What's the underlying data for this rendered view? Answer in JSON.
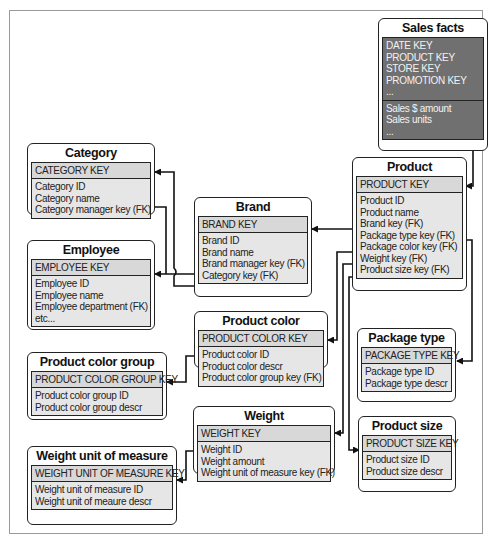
{
  "diagram": {
    "type": "snowflake-schema",
    "entities": {
      "sales_facts": {
        "title": "Sales facts",
        "keys": [
          "DATE KEY",
          "PRODUCT KEY",
          "STORE KEY",
          "PROMOTION KEY",
          "..."
        ],
        "attributes": [
          "Sales $ amount",
          "Sales units",
          "..."
        ]
      },
      "product": {
        "title": "Product",
        "key": "PRODUCT KEY",
        "attributes": [
          "Product ID",
          "Product name",
          "Brand key (FK)",
          "Package type key (FK)",
          "Package color key (FK)",
          "Weight key (FK)",
          "Product size key (FK)"
        ]
      },
      "category": {
        "title": "Category",
        "key": "CATEGORY KEY",
        "attributes": [
          "Category ID",
          "Category name",
          "Category manager key (FK)"
        ]
      },
      "employee": {
        "title": "Employee",
        "key": "EMPLOYEE KEY",
        "attributes": [
          "Employee ID",
          "Employee name",
          "Employee department (FK)",
          "etc..."
        ]
      },
      "brand": {
        "title": "Brand",
        "key": "BRAND KEY",
        "attributes": [
          "Brand ID",
          "Brand name",
          "Brand manager key (FK)",
          "Category key (FK)"
        ]
      },
      "product_color": {
        "title": "Product color",
        "key": "PRODUCT COLOR KEY",
        "attributes": [
          "Product color ID",
          "Product color descr",
          "Product color group key (FK)"
        ]
      },
      "product_color_group": {
        "title": "Product color group",
        "key": "PRODUCT COLOR GROUP KEY",
        "attributes": [
          "Product color group ID",
          "Product color group descr"
        ]
      },
      "package_type": {
        "title": "Package type",
        "key": "PACKAGE TYPE KEY",
        "attributes": [
          "Package type ID",
          "Package type descr"
        ]
      },
      "weight": {
        "title": "Weight",
        "key": "WEIGHT KEY",
        "attributes": [
          "Weight ID",
          "Weight amount",
          "Weight unit of measure key (FK)"
        ]
      },
      "product_size": {
        "title": "Product size",
        "key": "PRODUCT SIZE KEY",
        "attributes": [
          "Product size ID",
          "Product size descr"
        ]
      },
      "weight_unit_of_measure": {
        "title": "Weight unit of measure",
        "key": "WEIGHT UNIT OF MEASURE KEY",
        "attributes": [
          "Weight unit of measure ID",
          "Weight unit of meaure descr"
        ]
      }
    },
    "relationships": [
      {
        "from": "sales_facts.PRODUCT KEY",
        "to": "product.PRODUCT KEY"
      },
      {
        "from": "product.Brand key (FK)",
        "to": "brand.BRAND KEY"
      },
      {
        "from": "product.Package type key (FK)",
        "to": "package_type.PACKAGE TYPE KEY"
      },
      {
        "from": "product.Package color key (FK)",
        "to": "product_color.PRODUCT COLOR KEY"
      },
      {
        "from": "product.Weight key (FK)",
        "to": "weight.WEIGHT KEY"
      },
      {
        "from": "product.Product size key (FK)",
        "to": "product_size.PRODUCT SIZE KEY"
      },
      {
        "from": "brand.Brand manager key (FK)",
        "to": "employee.EMPLOYEE KEY"
      },
      {
        "from": "brand.Category key (FK)",
        "to": "category.CATEGORY KEY"
      },
      {
        "from": "product_color.Product color group key (FK)",
        "to": "product_color_group.PRODUCT COLOR GROUP KEY"
      },
      {
        "from": "weight.Weight unit of measure key (FK)",
        "to": "weight_unit_of_measure.WEIGHT UNIT OF MEASURE KEY"
      }
    ],
    "colors": {
      "fact_fill": "#707070",
      "key_fill": "#d8d8d8",
      "attr_fill": "#e6e6e6",
      "stroke": "#222222",
      "frame": "#9a9a9a"
    }
  }
}
